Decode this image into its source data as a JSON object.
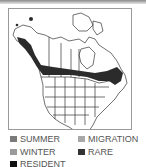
{
  "map": {
    "region": "North America",
    "colors": {
      "range": "#2b2b2b",
      "outline": "#333333",
      "land": "#ffffff"
    }
  },
  "legend": {
    "items": [
      {
        "label": "SUMMER",
        "color": "#7a7a7a"
      },
      {
        "label": "MIGRATION",
        "color": "#a8a8a8"
      },
      {
        "label": "WINTER",
        "color": "#9a9a9a"
      },
      {
        "label": "RARE",
        "color": "#333333"
      },
      {
        "label": "RESIDENT",
        "color": "#111111"
      }
    ]
  }
}
